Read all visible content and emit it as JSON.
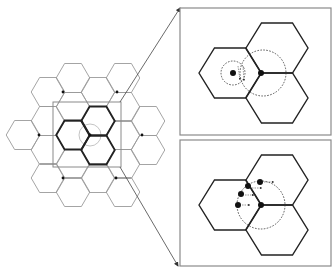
{
  "figure": {
    "colors": {
      "background": "#ffffff",
      "grid_line": "#9a9a9a",
      "bold_line": "#222222",
      "panel_border": "#8a8a8a",
      "dot": "#111111",
      "dashed": "#333333",
      "light_circle": "#b5b5b5"
    }
  },
  "overview_grid": {
    "hex_side": 16.8,
    "hex_half_height": 14.5,
    "cells": [
      [
        23,
        135
      ],
      [
        48,
        92
      ],
      [
        48,
        121
      ],
      [
        48,
        150
      ],
      [
        48,
        178
      ],
      [
        73,
        78
      ],
      [
        73,
        107
      ],
      [
        73,
        164
      ],
      [
        73,
        192
      ],
      [
        98,
        92
      ],
      [
        98,
        178
      ],
      [
        123,
        78
      ],
      [
        123,
        107
      ],
      [
        123,
        135
      ],
      [
        123,
        164
      ],
      [
        123,
        192
      ],
      [
        148,
        121
      ],
      [
        148,
        150
      ]
    ],
    "bold_cells": [
      [
        73,
        135
      ],
      [
        98,
        121
      ],
      [
        98,
        150
      ]
    ],
    "dots": [
      [
        63,
        92
      ],
      [
        117,
        92
      ],
      [
        39,
        135
      ],
      [
        142,
        135
      ],
      [
        63,
        178
      ],
      [
        116,
        178
      ],
      [
        90,
        135
      ]
    ],
    "focus_circle": {
      "cx": 90,
      "cy": 135,
      "r": 11
    },
    "selection_rect": {
      "x": 53,
      "y": 102,
      "w": 68,
      "h": 65
    }
  },
  "callout_arrows": [
    {
      "from": [
        120,
        102
      ],
      "to": [
        180,
        8
      ]
    },
    {
      "from": [
        120,
        167
      ],
      "to": [
        178,
        266
      ]
    }
  ],
  "panels": [
    {
      "name": "top-detail-panel",
      "rect": {
        "x": 180,
        "y": 8,
        "w": 151,
        "h": 127
      },
      "hex_side": 31,
      "hex_half_height": 25,
      "cells": [
        [
          230,
          73
        ],
        [
          277,
          48
        ],
        [
          277,
          98
        ]
      ],
      "dots": [
        [
          233,
          73
        ],
        [
          261,
          73
        ]
      ],
      "dashed_circles": [
        {
          "cx": 233,
          "cy": 73,
          "r": 12
        },
        {
          "cx": 263,
          "cy": 73,
          "r": 23
        }
      ],
      "small_arrows": [
        {
          "from": [
            238,
            66
          ],
          "to": [
            240,
            80
          ]
        },
        {
          "from": [
            243,
            66
          ],
          "to": [
            244,
            81
          ]
        }
      ]
    },
    {
      "name": "bottom-detail-panel",
      "rect": {
        "x": 180,
        "y": 140,
        "w": 151,
        "h": 126
      },
      "hex_side": 31,
      "hex_half_height": 25,
      "cells": [
        [
          230,
          205
        ],
        [
          277,
          180
        ],
        [
          277,
          230
        ]
      ],
      "dots": [
        [
          248,
          186
        ],
        [
          260,
          182
        ],
        [
          241,
          194
        ],
        [
          238,
          205
        ],
        [
          261,
          205
        ]
      ],
      "dashed_circles": [
        {
          "cx": 261,
          "cy": 205,
          "r": 24
        }
      ],
      "small_arrows": [
        {
          "from": [
            264,
            182
          ],
          "to": [
            274,
            182
          ]
        },
        {
          "from": [
            252,
            188
          ],
          "to": [
            262,
            188
          ]
        },
        {
          "from": [
            245,
            195
          ],
          "to": [
            254,
            195
          ]
        },
        {
          "from": [
            242,
            205
          ],
          "to": [
            250,
            205
          ]
        }
      ]
    }
  ]
}
